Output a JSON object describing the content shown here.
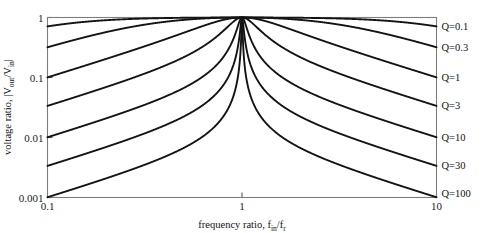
{
  "chart_data": {
    "type": "line",
    "title": "",
    "xlabel": "frequency ratio, f_in/f_r",
    "ylabel": "voltage ratio, |V_out/V_in|",
    "xscale": "log",
    "yscale": "log",
    "xlim": [
      0.1,
      10
    ],
    "ylim": [
      0.001,
      1
    ],
    "grid": false,
    "legend_position": "right-outside",
    "xtick_labels": [
      "0.1",
      "1",
      "10"
    ],
    "xtick_values": [
      0.1,
      1,
      10
    ],
    "ytick_labels": [
      "1",
      "0.1",
      "0.01",
      "0.001"
    ],
    "ytick_values": [
      1,
      0.1,
      0.01,
      0.001
    ],
    "formula": "1/sqrt(1 + Q^2*(f - 1/f)^2)",
    "series": [
      {
        "name": "Q=0.1",
        "Q": 0.1,
        "label": "Q=0.1",
        "endpoints": {
          "x_left": 0.1,
          "y_left": 0.742,
          "x_peak": 1,
          "y_peak": 1,
          "x_right": 10,
          "y_right": 0.742
        }
      },
      {
        "name": "Q=0.3",
        "Q": 0.3,
        "label": "Q=0.3",
        "endpoints": {
          "x_left": 0.1,
          "y_left": 0.34,
          "x_peak": 1,
          "y_peak": 1,
          "x_right": 10,
          "y_right": 0.34
        }
      },
      {
        "name": "Q=1",
        "Q": 1,
        "label": "Q=1",
        "endpoints": {
          "x_left": 0.1,
          "y_left": 0.1005,
          "x_peak": 1,
          "y_peak": 1,
          "x_right": 10,
          "y_right": 0.1005
        }
      },
      {
        "name": "Q=3",
        "Q": 3,
        "label": "Q=3",
        "endpoints": {
          "x_left": 0.1,
          "y_left": 0.0337,
          "x_peak": 1,
          "y_peak": 1,
          "x_right": 10,
          "y_right": 0.0337
        }
      },
      {
        "name": "Q=10",
        "Q": 10,
        "label": "Q=10",
        "endpoints": {
          "x_left": 0.1,
          "y_left": 0.0101,
          "x_peak": 1,
          "y_peak": 1,
          "x_right": 10,
          "y_right": 0.0101
        }
      },
      {
        "name": "Q=30",
        "Q": 30,
        "label": "Q=30",
        "endpoints": {
          "x_left": 0.1,
          "y_left": 0.00337,
          "x_peak": 1,
          "y_peak": 1,
          "x_right": 10,
          "y_right": 0.00337
        }
      },
      {
        "name": "Q=100",
        "Q": 100,
        "label": "Q=100",
        "endpoints": {
          "x_left": 0.1,
          "y_left": 0.00101,
          "x_peak": 1,
          "y_peak": 1,
          "x_right": 10,
          "y_right": 0.00101
        }
      }
    ]
  },
  "axes": {
    "x_title_prefix": "frequency ratio, f",
    "x_title_sub1": "in",
    "x_title_mid": "/f",
    "x_title_sub2": "r",
    "y_title_prefix": "voltage ratio, |V",
    "y_title_sub1": "out",
    "y_title_mid": "/V",
    "y_title_sub2": "in",
    "y_title_suffix": "|"
  },
  "colors": {
    "curve": "#141414",
    "frame": "#7d7d7d",
    "text": "#111111",
    "background": "#ffffff"
  }
}
